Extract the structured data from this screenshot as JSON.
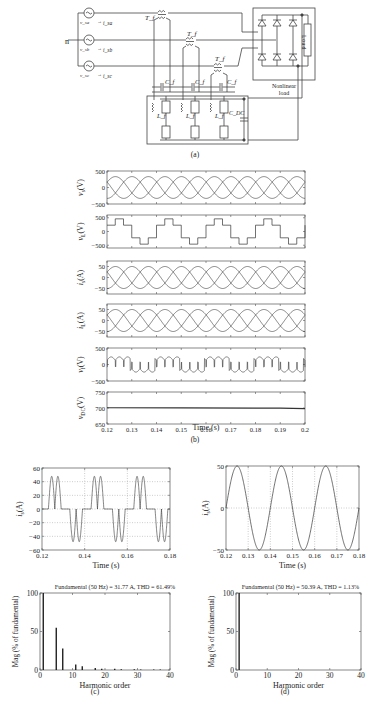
{
  "figure": {
    "panel_a": {
      "caption": "(a)",
      "labels": {
        "neutral": "n",
        "source_a": "v_sa",
        "current_a": "i_sa",
        "source_b": "v_sb",
        "current_b": "i_sb",
        "source_c": "v_sc",
        "current_c": "i_sc",
        "transformer": "T_f",
        "filter_cap": "C_f",
        "filter_ind": "L_f",
        "dc_cap": "C_DC",
        "load_box": "Load",
        "load_caption_1": "Nonlinear",
        "load_caption_2": "load"
      }
    },
    "panel_b": {
      "caption": "(b)",
      "xlabel": "Time (s)"
    },
    "panel_c": {
      "caption": "(c)"
    },
    "panel_d": {
      "caption": "(d)"
    }
  },
  "chart_data": [
    {
      "id": "b1",
      "type": "line",
      "ylabel": "v_s(V)",
      "xlim": [
        0.12,
        0.2
      ],
      "ylim": [
        -500,
        500
      ],
      "yticks": [
        500,
        0,
        -500
      ],
      "ytick_labels": [
        "500",
        "0",
        "-500"
      ],
      "series": [
        {
          "name": "phase a",
          "amplitude": 330,
          "freq_hz": 50,
          "phase_deg": 0
        },
        {
          "name": "phase b",
          "amplitude": 330,
          "freq_hz": 50,
          "phase_deg": -120
        },
        {
          "name": "phase c",
          "amplitude": 330,
          "freq_hz": 50,
          "phase_deg": 120
        }
      ]
    },
    {
      "id": "b2",
      "type": "line",
      "ylabel": "v_L(V)",
      "xlim": [
        0.12,
        0.2
      ],
      "ylim": [
        -600,
        600
      ],
      "yticks": [
        500,
        0,
        -500
      ],
      "ytick_labels": [
        "500",
        "0",
        "-500"
      ],
      "series": [
        {
          "name": "six-step load voltage",
          "levels": [
            230,
            460,
            230,
            -230,
            -460,
            -230
          ],
          "freq_hz": 50
        }
      ]
    },
    {
      "id": "b3",
      "type": "line",
      "ylabel": "i_s(A)",
      "xlim": [
        0.12,
        0.2
      ],
      "ylim": [
        -75,
        75
      ],
      "yticks": [
        50,
        0,
        -50
      ],
      "ytick_labels": [
        "50",
        "0",
        "-50"
      ],
      "series": [
        {
          "name": "phase a",
          "amplitude": 50,
          "freq_hz": 50,
          "phase_deg": 0
        },
        {
          "name": "phase b",
          "amplitude": 50,
          "freq_hz": 50,
          "phase_deg": -120
        },
        {
          "name": "phase c",
          "amplitude": 50,
          "freq_hz": 50,
          "phase_deg": 120
        }
      ]
    },
    {
      "id": "b4",
      "type": "line",
      "ylabel": "i_L(A)",
      "xlim": [
        0.12,
        0.2
      ],
      "ylim": [
        -75,
        75
      ],
      "yticks": [
        50,
        0,
        -50
      ],
      "ytick_labels": [
        "50",
        "0",
        "-50"
      ],
      "series": [
        {
          "name": "phase a",
          "amplitude": 50,
          "freq_hz": 50,
          "phase_deg": 0
        },
        {
          "name": "phase b",
          "amplitude": 50,
          "freq_hz": 50,
          "phase_deg": -120
        },
        {
          "name": "phase c",
          "amplitude": 50,
          "freq_hz": 50,
          "phase_deg": 120
        }
      ]
    },
    {
      "id": "b5",
      "type": "line",
      "ylabel": "v_f(V)",
      "xlim": [
        0.12,
        0.2
      ],
      "ylim": [
        -500,
        500
      ],
      "yticks": [
        500,
        0,
        -500
      ],
      "ytick_labels": [
        "500",
        "0",
        "-500"
      ],
      "series": [
        {
          "name": "filter voltage",
          "peak": 230,
          "freq_hz": 50
        }
      ]
    },
    {
      "id": "b6",
      "type": "line",
      "ylabel": "v_DC(V)",
      "xlabel": "Time (s)",
      "xlim": [
        0.12,
        0.2
      ],
      "ylim": [
        650,
        750
      ],
      "yticks": [
        750,
        700,
        650
      ],
      "ytick_labels": [
        "750",
        "700",
        "650"
      ],
      "xticks": [
        0.12,
        0.13,
        0.14,
        0.15,
        0.16,
        0.17,
        0.18,
        0.19,
        0.2
      ],
      "xtick_labels": [
        "0.12",
        "0.13",
        "0.14",
        "0.15",
        "0.16",
        "0.17",
        "0.18",
        "0.19",
        "0.2"
      ],
      "series": [
        {
          "name": "dc link voltage",
          "value": 700
        }
      ]
    },
    {
      "id": "c1",
      "type": "line",
      "ylabel": "i_s(A)",
      "xlabel": "Time (s)",
      "xlim": [
        0.12,
        0.18
      ],
      "ylim": [
        -60,
        60
      ],
      "grid": true,
      "yticks": [
        60,
        40,
        20,
        0,
        -20,
        -40,
        -60
      ],
      "ytick_labels": [
        "60",
        "40",
        "20",
        "0",
        "-20",
        "-40",
        "-60"
      ],
      "xticks": [
        0.12,
        0.14,
        0.16,
        0.18
      ],
      "xtick_labels": [
        "0.12",
        "0.14",
        "0.16",
        "0.18"
      ],
      "series": [
        {
          "name": "distorted source current",
          "peak": 50,
          "freq_hz": 50
        }
      ]
    },
    {
      "id": "d1",
      "type": "line",
      "ylabel": "i_s(A)",
      "xlabel": "Time (s)",
      "xlim": [
        0.12,
        0.18
      ],
      "ylim": [
        -50,
        50
      ],
      "grid": true,
      "yticks": [
        50,
        0,
        -50
      ],
      "ytick_labels": [
        "50",
        "0",
        "-50"
      ],
      "xticks": [
        0.12,
        0.13,
        0.14,
        0.15,
        0.16,
        0.17,
        0.18
      ],
      "xtick_labels": [
        "0.12",
        "0.13",
        "0.14",
        "0.15",
        "0.16",
        "0.17",
        "0.18"
      ],
      "series": [
        {
          "name": "compensated source current",
          "amplitude": 50.39,
          "freq_hz": 50
        }
      ]
    },
    {
      "id": "c2",
      "type": "bar",
      "title": "Fundamental (50 Hz) = 31.77 A, THD = 61.49%",
      "xlabel": "Harmonic order",
      "ylabel": "Mag (% of fundamental)",
      "xlim": [
        0,
        40
      ],
      "ylim": [
        0,
        100
      ],
      "xticks": [
        0,
        10,
        20,
        30,
        40
      ],
      "yticks": [
        100,
        50,
        0
      ],
      "categories": [
        1,
        5,
        7,
        11,
        13,
        17,
        19,
        23,
        25,
        29,
        31,
        35,
        37
      ],
      "values": [
        100,
        55,
        28,
        7,
        5,
        2.5,
        1.5,
        1.5,
        1,
        1,
        0.8,
        0.8,
        0.6
      ]
    },
    {
      "id": "d2",
      "type": "bar",
      "title": "Fundamental (50 Hz) = 50.39 A, THD = 1.13%",
      "xlabel": "Harmonic order",
      "ylabel": "Mag (% of fundamental)",
      "xlim": [
        0,
        40
      ],
      "ylim": [
        0,
        100
      ],
      "xticks": [
        0,
        10,
        20,
        30,
        40
      ],
      "yticks": [
        100,
        50,
        0
      ],
      "categories": [
        1
      ],
      "values": [
        100
      ]
    }
  ]
}
